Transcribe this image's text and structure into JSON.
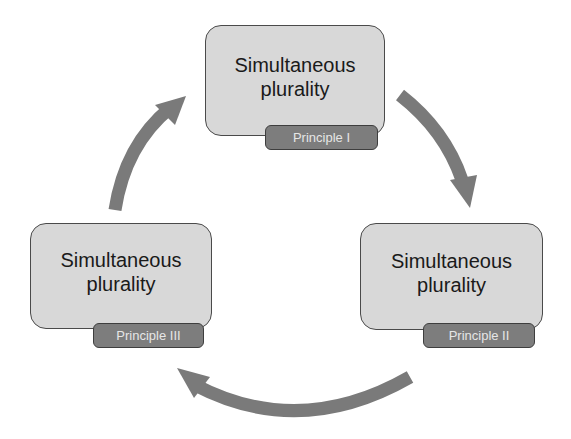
{
  "nodes": [
    {
      "id": "top",
      "lines": [
        "Simultaneous",
        "plurality"
      ],
      "badge": "Principle I"
    },
    {
      "id": "right",
      "lines": [
        "Simultaneous",
        "plurality"
      ],
      "badge": "Principle II"
    },
    {
      "id": "left",
      "lines": [
        "Simultaneous",
        "plurality"
      ],
      "badge": "Principle III"
    }
  ],
  "colors": {
    "box_fill": "#d8d8d8",
    "badge_fill": "#7d7d7d",
    "arrow": "#7a7a7a",
    "text": "#1a1a1a"
  }
}
